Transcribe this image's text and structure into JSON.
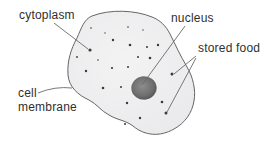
{
  "figure": {
    "background": "#ffffff",
    "text_color": "#2f2f2f"
  },
  "labels": {
    "cytoplasm": "cytoplasm",
    "nucleus": "nucleus",
    "stored_food": "stored food",
    "cell_membrane_line1": "cell",
    "cell_membrane_line2": "membrane"
  },
  "diagram": {
    "cell_path": "M 92,16 C 110,9 135,10 152,17 C 160,20 166,26 170,34 C 176,46 180,55 187,67 C 193,77 196,90 194,101 C 192,113 185,123 174,129 C 160,137 145,136 133,126 C 125,120 117,120 109,115 C 101,111 97,104 89,100 C 78,95 69,87 68,75 C 67,61 71,49 77,38 C 81,29 84,19 92,16 Z",
    "cell_fill_center": "#f4f3f4",
    "cell_fill_edge": "#e9e8ea",
    "cell_stroke": "#666666",
    "nucleus": {
      "cx": 144,
      "cy": 88,
      "rx": 12.5,
      "ry": 11.5,
      "rotate": -6
    },
    "nucleus_fill_center": "#8d8d8d",
    "nucleus_fill_mid": "#6e6e6e",
    "nucleus_fill_edge": "#4f4f4f",
    "granule_color": "#3a3a3a",
    "line_color": "#6a6a6a",
    "granules": [
      {
        "x": 91,
        "y": 28,
        "r": 0.8
      },
      {
        "x": 128,
        "y": 27,
        "r": 0.8
      },
      {
        "x": 105,
        "y": 33,
        "r": 0.7
      },
      {
        "x": 143,
        "y": 30,
        "r": 0.7
      },
      {
        "x": 113,
        "y": 40,
        "r": 1.2
      },
      {
        "x": 130,
        "y": 45,
        "r": 1.3
      },
      {
        "x": 147,
        "y": 47,
        "r": 1.0
      },
      {
        "x": 158,
        "y": 45,
        "r": 1.2
      },
      {
        "x": 90,
        "y": 50,
        "r": 1.6
      },
      {
        "x": 77,
        "y": 57,
        "r": 0.9
      },
      {
        "x": 138,
        "y": 57,
        "r": 1.0
      },
      {
        "x": 150,
        "y": 58,
        "r": 1.3
      },
      {
        "x": 98,
        "y": 60,
        "r": 0.8
      },
      {
        "x": 112,
        "y": 68,
        "r": 1.1
      },
      {
        "x": 128,
        "y": 67,
        "r": 1.0
      },
      {
        "x": 86,
        "y": 71,
        "r": 1.2
      },
      {
        "x": 172,
        "y": 74,
        "r": 1.5
      },
      {
        "x": 103,
        "y": 88,
        "r": 1.3
      },
      {
        "x": 121,
        "y": 87,
        "r": 1.0
      },
      {
        "x": 127,
        "y": 103,
        "r": 1.2
      },
      {
        "x": 162,
        "y": 102,
        "r": 1.3
      },
      {
        "x": 166,
        "y": 113,
        "r": 1.5
      },
      {
        "x": 140,
        "y": 118,
        "r": 1.2
      },
      {
        "x": 125,
        "y": 124,
        "r": 1.0
      }
    ],
    "pointer_lines": [
      {
        "name": "cytoplasm-pointer",
        "d": "M54,23 L88,49"
      },
      {
        "name": "nucleus-pointer",
        "d": "M185,26 L142,85"
      },
      {
        "name": "stored-food-pointer-a",
        "d": "M196,56 L174,74"
      },
      {
        "name": "stored-food-pointer-b",
        "d": "M196,58 L167,112"
      },
      {
        "name": "cell-membrane-pointer",
        "d": "M38,93 Q55,86 72,88"
      }
    ]
  }
}
